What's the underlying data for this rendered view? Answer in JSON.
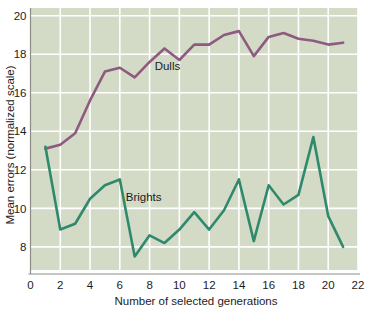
{
  "chart_data": {
    "type": "line",
    "title": "",
    "subtitle": "",
    "xlabel": "Number of selected generations",
    "ylabel": "Mean errors (normalized scale)",
    "xlim": [
      0,
      22
    ],
    "ylim": [
      6.8,
      20.4
    ],
    "xticks": [
      0,
      2,
      4,
      6,
      8,
      10,
      12,
      14,
      16,
      18,
      20,
      22
    ],
    "xtick_labels": [
      "0",
      "2",
      "4",
      "6",
      "8",
      "10",
      "12",
      "14",
      "16",
      "18",
      "20",
      "22"
    ],
    "yticks": [
      8,
      10,
      12,
      14,
      16,
      18,
      20
    ],
    "ytick_labels": [
      "8",
      "10",
      "12",
      "14",
      "16",
      "18",
      "20"
    ],
    "grid": true,
    "grid_color": "#ffffff",
    "plot_background": "#d3dac6",
    "figure_background": "#ffffff",
    "legend_position": "inline-annotation",
    "x": [
      1,
      2,
      3,
      4,
      5,
      6,
      7,
      8,
      9,
      10,
      11,
      12,
      13,
      14,
      15,
      16,
      17,
      18,
      19,
      20,
      21
    ],
    "series": [
      {
        "name": "Dulls",
        "color": "#8e5a80",
        "label_x": 9.2,
        "label_y": 17.2,
        "values": [
          13.1,
          13.3,
          13.9,
          15.6,
          17.1,
          17.3,
          16.8,
          17.6,
          18.3,
          17.7,
          18.5,
          18.5,
          19.0,
          19.2,
          17.9,
          18.9,
          19.1,
          18.8,
          18.7,
          18.5,
          18.6
        ]
      },
      {
        "name": "Brights",
        "color": "#2f8a6d",
        "label_x": 7.6,
        "label_y": 10.4,
        "values": [
          13.2,
          8.9,
          9.2,
          10.5,
          11.2,
          11.5,
          7.5,
          8.6,
          8.2,
          8.9,
          9.8,
          8.9,
          9.9,
          11.5,
          8.3,
          11.2,
          10.2,
          10.7,
          13.7,
          9.6,
          8.0
        ]
      }
    ]
  }
}
